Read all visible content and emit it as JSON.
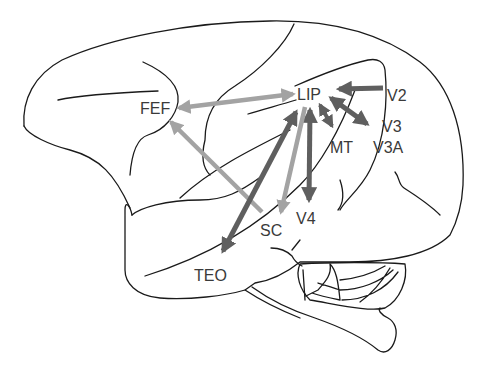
{
  "figure": {
    "colors": {
      "outline": "#1a1a1a",
      "label": "#3a3a3a",
      "arrow_dark": "#5f5f5f",
      "arrow_light": "#a3a3a3"
    }
  },
  "labels": {
    "lip": "LIP",
    "fef": "FEF",
    "v2": "V2",
    "v3": "V3",
    "v3a": "V3A",
    "mt": "MT",
    "v4": "V4",
    "sc": "SC",
    "teo": "TEO"
  },
  "connections": [
    {
      "from": "LIP",
      "to": "FEF",
      "direction": "bidirectional",
      "shade": "light"
    },
    {
      "from": "SC",
      "to": "FEF",
      "direction": "to FEF",
      "shade": "light"
    },
    {
      "from": "V2",
      "to": "LIP",
      "direction": "to LIP",
      "shade": "dark"
    },
    {
      "from": "LIP",
      "to": "V3/V3A",
      "direction": "bidirectional",
      "shade": "dark"
    },
    {
      "from": "LIP",
      "to": "MT",
      "direction": "bidirectional",
      "shade": "dark"
    },
    {
      "from": "LIP",
      "to": "V4",
      "direction": "bidirectional",
      "shade": "dark"
    },
    {
      "from": "LIP",
      "to": "SC",
      "direction": "to SC",
      "shade": "light"
    },
    {
      "from": "LIP",
      "to": "TEO",
      "direction": "bidirectional",
      "shade": "dark"
    }
  ]
}
